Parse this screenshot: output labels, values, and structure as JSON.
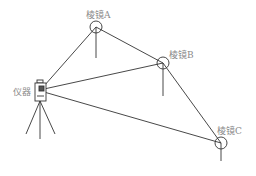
{
  "diagram": {
    "title": "",
    "labels": {
      "prism_a": "棱镜A",
      "prism_b": "棱镜B",
      "prism_c": "棱镜C",
      "instrument": "仪器"
    },
    "colors": {
      "line": "#333333",
      "label": "#8a8a8a"
    }
  }
}
